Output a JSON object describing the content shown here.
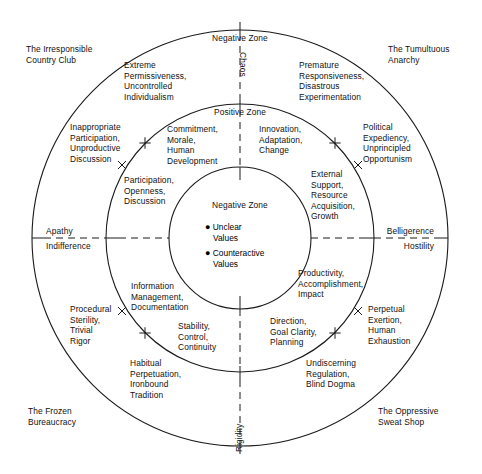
{
  "diagram": {
    "geometry": {
      "center_x": 240,
      "center_y": 238,
      "outer_radius": 208,
      "middle_radius": 134,
      "inner_radius": 71,
      "stroke_color": "#1a1a1a"
    },
    "axes": {
      "vertical_top_label": "Chaos",
      "vertical_bottom_label": "Rigidity",
      "left_upper_label": "Apathy",
      "left_lower_label": "Indifference",
      "right_upper_label": "Belligerence",
      "right_lower_label": "Hostility"
    },
    "zones": {
      "outer_ring_label": "Negative Zone",
      "middle_ring_label": "Positive Zone",
      "core_label": "Negative Zone",
      "core_bullets": [
        "Unclear\nValues",
        "Counteractive\nValues"
      ]
    },
    "corners": [
      {
        "name": "top-left",
        "text": "The Irresponsible\nCountry Club"
      },
      {
        "name": "top-right",
        "text": "The Tumultuous\nAnarchy"
      },
      {
        "name": "bottom-left",
        "text": "The Frozen\nBureaucracy"
      },
      {
        "name": "bottom-right",
        "text": "The Oppressive\nSweat Shop"
      }
    ],
    "outer_ring_items": [
      {
        "name": "extreme-permissiveness",
        "text": "Extreme\nPermissiveness,\nUncontrolled\nIndividualism"
      },
      {
        "name": "premature-responsiveness",
        "text": "Premature\nResponsiveness,\nDisastrous\nExperimentation"
      },
      {
        "name": "inappropriate-participation",
        "text": "Inappropriate\nParticipation,\nUnproductive\nDiscussion"
      },
      {
        "name": "political-expediency",
        "text": "Political\nExpediency,\nUnprincipled\nOpportunism"
      },
      {
        "name": "procedural-sterility",
        "text": "Procedural\nSterility,\nTrivial\nRigor"
      },
      {
        "name": "perpetual-exertion",
        "text": "Perpetual\nExertion,\nHuman\nExhaustion"
      },
      {
        "name": "habitual-perpetuation",
        "text": "Habitual\nPerpetuation,\nIronbound\nTradition"
      },
      {
        "name": "undiscerning-regulation",
        "text": "Undiscerning\nRegulation,\nBlind Dogma"
      }
    ],
    "middle_ring_items": [
      {
        "name": "commitment-morale",
        "text": "Commitment,\nMorale,\nHuman\nDevelopment"
      },
      {
        "name": "innovation-adaptation",
        "text": "Innovation,\nAdaptation,\nChange"
      },
      {
        "name": "participation-openness",
        "text": "Participation,\nOpenness,\nDiscussion"
      },
      {
        "name": "external-support",
        "text": "External\nSupport,\nResource\nAcquisition,\nGrowth"
      },
      {
        "name": "information-management",
        "text": "Information\nManagement,\nDocumentation"
      },
      {
        "name": "productivity-accomplishment",
        "text": "Productivity,\nAccomplishment,\nImpact"
      },
      {
        "name": "stability-control",
        "text": "Stability,\nControl,\nContinuity"
      },
      {
        "name": "direction-goal-clarity",
        "text": "Direction,\nGoal Clarity,\nPlanning"
      }
    ]
  }
}
